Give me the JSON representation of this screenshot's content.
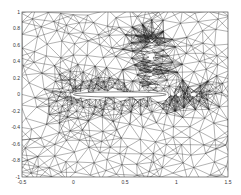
{
  "figure": {
    "type": "unstructured triangular mesh around airfoil",
    "plot_box": {
      "left": 22,
      "top": 12,
      "right": 228,
      "bottom": 177
    },
    "x_axis": {
      "min": -0.5,
      "max": 1.5,
      "ticks": [
        "-0.5",
        "0",
        "0.5",
        "1",
        "1.5"
      ]
    },
    "y_axis": {
      "min": -1,
      "max": 1,
      "ticks": [
        "-1",
        "-0.8",
        "-0.6",
        "-0.4",
        "-0.2",
        "0",
        "0.2",
        "0.4",
        "0.6",
        "0.8",
        "1"
      ]
    },
    "airfoil": {
      "x_start": 0,
      "x_end": 0.9,
      "y": 0,
      "thickness": 0.05
    },
    "refinement_regions": [
      {
        "name": "leading-edge",
        "x": 0.0,
        "y": 0.0
      },
      {
        "name": "shock",
        "x": 0.75,
        "y_range": [
          0.05,
          0.7
        ]
      },
      {
        "name": "wake",
        "x_range": [
          0.95,
          1.2
        ],
        "y": 0.0
      }
    ],
    "colors": {
      "line": "#222222",
      "background": "#ffffff",
      "airfoil": "#ffffff"
    }
  }
}
